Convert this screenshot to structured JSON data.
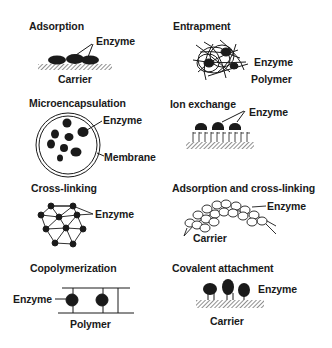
{
  "diagram": {
    "type": "enzyme-immobilization-methods",
    "panels": [
      {
        "id": "adsorption",
        "title": "Adsorption",
        "labels": {
          "enzyme": "Enzyme",
          "support": "Carrier"
        }
      },
      {
        "id": "entrapment",
        "title": "Entrapment",
        "labels": {
          "enzyme": "Enzyme",
          "support": "Polymer"
        }
      },
      {
        "id": "microencapsulation",
        "title": "Microencapsulation",
        "labels": {
          "enzyme": "Enzyme",
          "support": "Membrane"
        }
      },
      {
        "id": "ion-exchange",
        "title": "Ion exchange",
        "labels": {
          "enzyme": "Enzyme"
        }
      },
      {
        "id": "cross-linking",
        "title": "Cross-linking",
        "labels": {
          "enzyme": "Enzyme"
        }
      },
      {
        "id": "adsorption-cross-linking",
        "title": "Adsorption and cross-linking",
        "labels": {
          "enzyme": "Enzyme",
          "support": "Carrier"
        }
      },
      {
        "id": "copolymerization",
        "title": "Copolymerization",
        "labels": {
          "enzyme": "Enzyme",
          "support": "Polymer"
        }
      },
      {
        "id": "covalent-attachment",
        "title": "Covalent attachment",
        "labels": {
          "enzyme": "Enzyme",
          "support": "Carrier"
        }
      }
    ]
  }
}
